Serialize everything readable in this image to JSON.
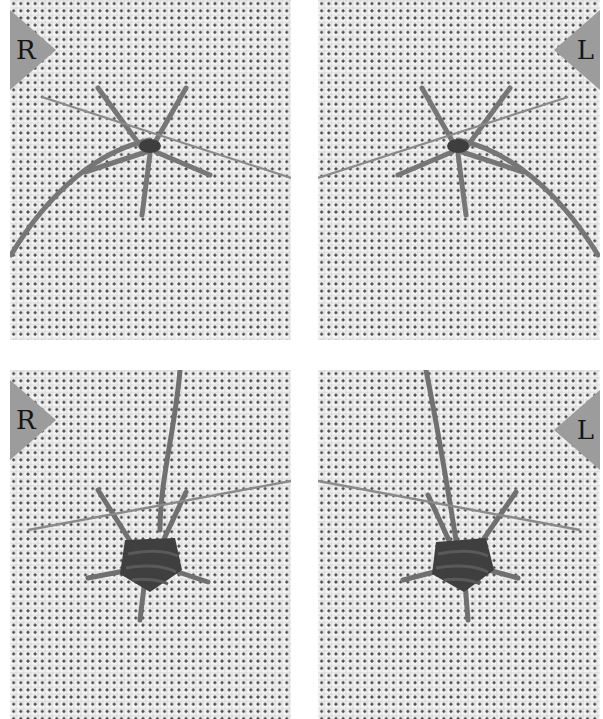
{
  "image": {
    "description": "Four-panel grayscale embroidery tutorial showing a woven wheel (spider web) stitch on evenweave cloth with needle and thread",
    "background_color": "#ffffff",
    "cloth_color": "#f4f4f4",
    "thread_color": "#6e6e6e",
    "badge_color": "#9c9c9c"
  },
  "panels": [
    {
      "id": "top-left",
      "badge": "R",
      "badge_side": "left",
      "stage": "spokes laid, needle weaving first round"
    },
    {
      "id": "top-right",
      "badge": "L",
      "badge_side": "right",
      "stage": "spokes laid, needle weaving first round"
    },
    {
      "id": "bottom-left",
      "badge": "R",
      "badge_side": "left",
      "stage": "wheel partially woven, needle passing under spokes"
    },
    {
      "id": "bottom-right",
      "badge": "L",
      "badge_side": "right",
      "stage": "wheel partially woven, needle passing under spokes"
    }
  ]
}
